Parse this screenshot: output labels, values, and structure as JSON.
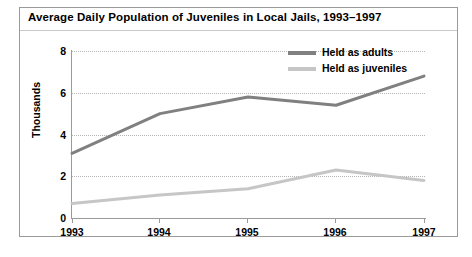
{
  "figure": {
    "title": "Average Daily Population of Juveniles in Local Jails, 1993–1997",
    "frame_color": "#9a9a9a",
    "background": "#ffffff"
  },
  "legend": {
    "position": "top-right",
    "entries": [
      {
        "label": "Held as adults",
        "color": "#808080"
      },
      {
        "label": "Held as juveniles",
        "color": "#c6c6c6"
      }
    ]
  },
  "axes": {
    "ylabel": "Thousands",
    "yticks": [
      "0",
      "2",
      "4",
      "6",
      "8"
    ],
    "xticks": [
      "1993",
      "1994",
      "1995",
      "1996",
      "1997"
    ],
    "axis_color": "#9b9b9b",
    "grid_color": "#b4b4b4"
  },
  "chart_data": {
    "type": "line",
    "title": "Average Daily Population of Juveniles in Local Jails, 1993–1997",
    "xlabel": "",
    "ylabel": "Thousands",
    "categories": [
      "1993",
      "1994",
      "1995",
      "1996",
      "1997"
    ],
    "x": [
      1993,
      1994,
      1995,
      1996,
      1997
    ],
    "series": [
      {
        "name": "Held as adults",
        "color": "#808080",
        "values": [
          3.1,
          5.0,
          5.8,
          5.4,
          6.8
        ]
      },
      {
        "name": "Held as juveniles",
        "color": "#c6c6c6",
        "values": [
          0.7,
          1.1,
          1.4,
          2.3,
          1.8
        ]
      }
    ],
    "ylim": [
      0,
      8
    ],
    "ytick_values": [
      0,
      2,
      4,
      6,
      8
    ],
    "grid": "horizontal-dotted",
    "legend_position": "top-right"
  }
}
